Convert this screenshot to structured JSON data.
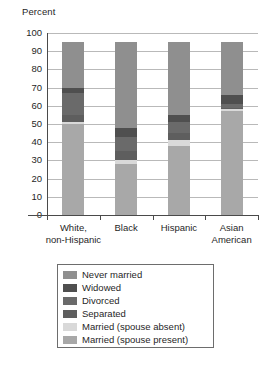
{
  "chart_data": {
    "type": "bar",
    "subtype": "stacked-bar-100",
    "title": "",
    "xlabel": "",
    "ylabel": "Percent",
    "ylim": [
      0,
      100
    ],
    "yticks": [
      100,
      90,
      80,
      70,
      60,
      50,
      40,
      30,
      20,
      10,
      0
    ],
    "grid": true,
    "legend_position": "below",
    "categories": [
      "White, non-Hispanic",
      "Black",
      "Hispanic",
      "Asian American"
    ],
    "category_lines": [
      [
        "White,",
        "non-Hispanic"
      ],
      [
        "Black"
      ],
      [
        "Hispanic"
      ],
      [
        "Asian",
        "American"
      ]
    ],
    "series": [
      {
        "name": "Never married",
        "color": "#8f8f8f",
        "values": [
          25,
          47,
          40,
          29
        ]
      },
      {
        "name": "Widowed",
        "color": "#4f4f4f",
        "values": [
          3,
          5,
          4,
          5
        ]
      },
      {
        "name": "Divorced",
        "color": "#6a6a6a",
        "values": [
          12,
          8,
          6,
          2
        ]
      },
      {
        "name": "Separated",
        "color": "#5e5e5e",
        "values": [
          4,
          5,
          4,
          1
        ]
      },
      {
        "name": "Married (spouse absent)",
        "color": "#d9d9d9",
        "values": [
          1,
          2,
          3,
          1
        ]
      },
      {
        "name": "Married (spouse present)",
        "color": "#a8a8a8",
        "values": [
          50,
          28,
          38,
          57
        ]
      }
    ],
    "totals": [
      95,
      95,
      95,
      95
    ]
  },
  "legend": {
    "items": [
      {
        "label": "Never married",
        "color": "#8f8f8f"
      },
      {
        "label": "Widowed",
        "color": "#4f4f4f"
      },
      {
        "label": "Divorced",
        "color": "#6a6a6a"
      },
      {
        "label": "Separated",
        "color": "#5e5e5e"
      },
      {
        "label": "Married (spouse absent)",
        "color": "#d9d9d9"
      },
      {
        "label": "Married (spouse present)",
        "color": "#a8a8a8"
      }
    ]
  },
  "colors": {
    "axis": "#4a4a4a",
    "grid": "#b9b9b9",
    "text": "#1f1f1f",
    "background": "#ffffff"
  }
}
